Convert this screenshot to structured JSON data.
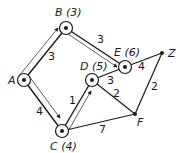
{
  "diagram": {
    "type": "weighted-network-shortest-path",
    "nodes": [
      {
        "id": "A",
        "label": "A",
        "value": "",
        "x": 24,
        "y": 80,
        "circled": true
      },
      {
        "id": "B",
        "label": "B",
        "value": "(3)",
        "x": 66,
        "y": 28,
        "circled": true
      },
      {
        "id": "C",
        "label": "C",
        "value": "(4)",
        "x": 62,
        "y": 131,
        "circled": true
      },
      {
        "id": "D",
        "label": "D",
        "value": "(5)",
        "x": 92,
        "y": 80,
        "circled": true
      },
      {
        "id": "E",
        "label": "E",
        "value": "(6)",
        "x": 125,
        "y": 67,
        "circled": true
      },
      {
        "id": "Z",
        "label": "Z",
        "value": "",
        "x": 162,
        "y": 53,
        "circled": false
      },
      {
        "id": "F",
        "label": "F",
        "value": "",
        "x": 135,
        "y": 114,
        "circled": false
      }
    ],
    "edges": [
      {
        "from": "A",
        "to": "B",
        "weight": "3",
        "highlighted": true
      },
      {
        "from": "A",
        "to": "C",
        "weight": "4",
        "highlighted": true
      },
      {
        "from": "B",
        "to": "E",
        "weight": "3",
        "highlighted": true
      },
      {
        "from": "C",
        "to": "D",
        "weight": "1",
        "highlighted": true
      },
      {
        "from": "D",
        "to": "E",
        "weight": "3",
        "highlighted": false
      },
      {
        "from": "E",
        "to": "Z",
        "weight": "4",
        "highlighted": false
      },
      {
        "from": "D",
        "to": "F",
        "weight": "2",
        "highlighted": false
      },
      {
        "from": "C",
        "to": "F",
        "weight": "7",
        "highlighted": false
      },
      {
        "from": "F",
        "to": "Z",
        "weight": "2",
        "highlighted": false
      }
    ]
  },
  "labels": {
    "A": "A",
    "B": "B (3)",
    "C": "C (4)",
    "D": "D (5)",
    "E": "E (6)",
    "Z": "Z",
    "F": "F"
  },
  "weights": {
    "AB": "3",
    "AC": "4",
    "BE": "3",
    "CD": "1",
    "DE": "3",
    "EZ": "4",
    "DF": "2",
    "CF": "7",
    "FZ": "2"
  },
  "colors": {
    "line": "#1a1a1a",
    "highlight": "#1a1a1a"
  }
}
